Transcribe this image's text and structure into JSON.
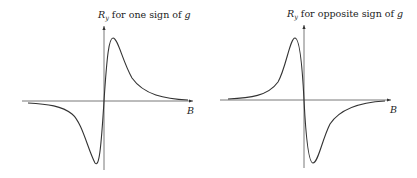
{
  "panels": [
    {
      "title_symbol": "R",
      "title_subscript": "y",
      "title_text": " for one sign of ",
      "title_var": "g",
      "x_axis_label": "B",
      "curve": "dispersive lineshape: positive peak for B>0, negative trough for B<0"
    },
    {
      "title_symbol": "R",
      "title_subscript": "y",
      "title_text": " for opposite sign of ",
      "title_var": "g",
      "x_axis_label": "B",
      "curve": "dispersive lineshape: positive peak for B<0, negative trough for B>0"
    }
  ],
  "colors": {
    "line": "#333333",
    "axis": "#555555"
  }
}
